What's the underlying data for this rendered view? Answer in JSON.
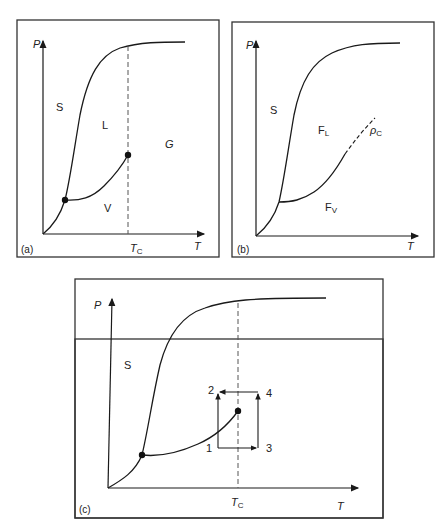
{
  "header": {
    "page_fragment": ""
  },
  "panels": [
    {
      "id": "a",
      "caption": "(a)",
      "axes": {
        "y": "P",
        "x": "T"
      },
      "regions": {
        "solid": "S",
        "liquid": "L",
        "vapor": "V",
        "gas": "G"
      },
      "tc_label": "T",
      "tc_sub": "C",
      "points": [
        "triple-point",
        "critical-point"
      ]
    },
    {
      "id": "b",
      "caption": "(b)",
      "axes": {
        "y": "P",
        "x": "T"
      },
      "regions": {
        "solid": "S",
        "fluid_liquid": "F",
        "fluid_liquid_sub": "L",
        "fluid_vapor": "F",
        "fluid_vapor_sub": "V"
      },
      "density_label": "ρ",
      "density_sub": "C"
    },
    {
      "id": "c",
      "caption": "(c)",
      "axes": {
        "y": "P",
        "x": "T"
      },
      "regions": {
        "solid": "S"
      },
      "tc_label": "T",
      "tc_sub": "C",
      "path_states": [
        "1",
        "2",
        "3",
        "4"
      ]
    }
  ],
  "colors": {
    "line": "#1a1a1a",
    "border": "#333333",
    "dash": "#555555"
  }
}
